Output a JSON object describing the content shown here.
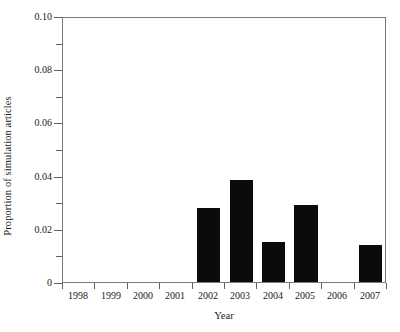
{
  "chart_data": {
    "type": "bar",
    "title": "",
    "xlabel": "Year",
    "ylabel": "Proportion of simulation articles",
    "categories": [
      "1998",
      "1999",
      "2000",
      "2001",
      "2002",
      "2003",
      "2004",
      "2005",
      "2006",
      "2007"
    ],
    "values": [
      0,
      0,
      0,
      0,
      0.028,
      0.0385,
      0.015,
      0.029,
      0,
      0.014
    ],
    "series": [
      {
        "name": "Proportion of simulation articles",
        "values": [
          0,
          0,
          0,
          0,
          0.028,
          0.0385,
          0.015,
          0.029,
          0,
          0.014
        ]
      }
    ],
    "ylim": [
      0,
      0.1
    ],
    "ytick_values": [
      0,
      0.01,
      0.02,
      0.03,
      0.04,
      0.05,
      0.06,
      0.07,
      0.08,
      0.09,
      0.1
    ],
    "ytick_labels": [
      "0",
      "",
      "0.02",
      "",
      "0.04",
      "",
      "0.06",
      "",
      "0.08",
      "",
      "0.10"
    ],
    "xtick_labels": [
      "1998",
      "1999",
      "2000",
      "2001",
      "2002",
      "2003",
      "2004",
      "2005",
      "2006",
      "2007"
    ],
    "grid": false,
    "legend": null,
    "bar_color": "#0b0b0b",
    "frame_color": "#7a7a7a",
    "background": "#ffffff"
  }
}
